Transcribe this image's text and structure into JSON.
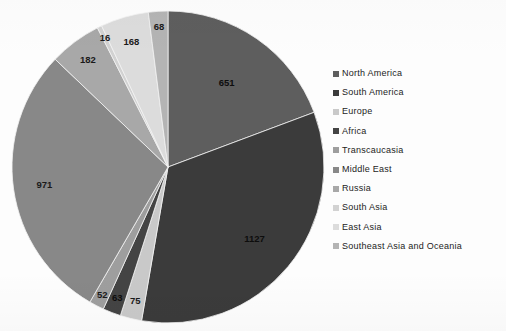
{
  "chart_data": {
    "type": "pie",
    "title": "",
    "subtitle": "",
    "xlabel": "",
    "ylabel": "",
    "grid": false,
    "legend_position": "right",
    "start_angle_deg": 0,
    "direction": "clockwise",
    "total": 3373,
    "categories": [
      "North America",
      "South America",
      "Europe",
      "Africa",
      "Transcaucasia",
      "Middle East",
      "Russia",
      "South Asia",
      "East Asia",
      "Southeast Asia and Oceania"
    ],
    "values": [
      651,
      1127,
      75,
      63,
      52,
      971,
      182,
      16,
      168,
      68
    ],
    "labels": [
      "651",
      "1127",
      "75",
      "63",
      "52",
      "971",
      "182",
      "16",
      "168",
      "68"
    ],
    "colors": [
      "#5e5e5e",
      "#3b3b3b",
      "#c9c9c9",
      "#444444",
      "#9e9e9e",
      "#888888",
      "#a8a8a8",
      "#d2d2d2",
      "#dcdcdc",
      "#b4b4b4"
    ],
    "slices": [
      {
        "label": "North America",
        "value": 651,
        "display": "651",
        "color": "#5e5e5e"
      },
      {
        "label": "South America",
        "value": 1127,
        "display": "1127",
        "color": "#3b3b3b"
      },
      {
        "label": "Europe",
        "value": 75,
        "display": "75",
        "color": "#c9c9c9"
      },
      {
        "label": "Africa",
        "value": 63,
        "display": "63",
        "color": "#444444"
      },
      {
        "label": "Transcaucasia",
        "value": 52,
        "display": "52",
        "color": "#9e9e9e"
      },
      {
        "label": "Middle East",
        "value": 971,
        "display": "971",
        "color": "#888888"
      },
      {
        "label": "Russia",
        "value": 182,
        "display": "182",
        "color": "#a8a8a8"
      },
      {
        "label": "South Asia",
        "value": 16,
        "display": "16",
        "color": "#d2d2d2"
      },
      {
        "label": "East Asia",
        "value": 168,
        "display": "168",
        "color": "#dcdcdc"
      },
      {
        "label": "Southeast Asia and Oceania",
        "value": 68,
        "display": "68",
        "color": "#b4b4b4"
      }
    ]
  },
  "legend": {
    "items": [
      {
        "label": "North America",
        "color": "#5e5e5e"
      },
      {
        "label": "South America",
        "color": "#3b3b3b"
      },
      {
        "label": "Europe",
        "color": "#c9c9c9"
      },
      {
        "label": "Africa",
        "color": "#444444"
      },
      {
        "label": "Transcaucasia",
        "color": "#9e9e9e"
      },
      {
        "label": "Middle East",
        "color": "#888888"
      },
      {
        "label": "Russia",
        "color": "#a8a8a8"
      },
      {
        "label": "South Asia",
        "color": "#d2d2d2"
      },
      {
        "label": "East Asia",
        "color": "#dcdcdc"
      },
      {
        "label": "Southeast Asia and Oceania",
        "color": "#b4b4b4"
      }
    ]
  }
}
